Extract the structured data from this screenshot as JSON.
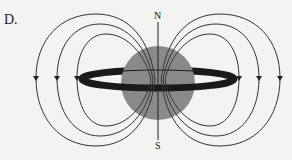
{
  "option_label": "D.",
  "north_label": "N",
  "south_label": "S",
  "colors": {
    "background": "#f3f3f1",
    "planet": "#8a8a8a",
    "ring": "#1a1a1a",
    "field_lines": "#333333"
  }
}
